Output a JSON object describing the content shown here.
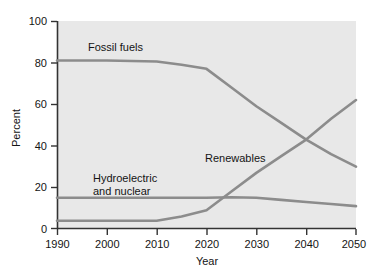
{
  "chart_data": {
    "type": "line",
    "title": "",
    "xlabel": "Year",
    "ylabel": "Percent",
    "xlim": [
      1990,
      2050
    ],
    "ylim": [
      0,
      100
    ],
    "grid": false,
    "legend_position": "inline-annotations",
    "xticks": [
      "1990",
      "2000",
      "2010",
      "2020",
      "2030",
      "2040",
      "2050"
    ],
    "xtick_values": [
      1990,
      2000,
      2010,
      2020,
      2030,
      2040,
      2050
    ],
    "yticks": [
      "0",
      "20",
      "40",
      "60",
      "80",
      "100"
    ],
    "ytick_values": [
      0,
      20,
      40,
      60,
      80,
      100
    ],
    "series": [
      {
        "name": "Fossil fuels",
        "color": "#8c8c8c",
        "x": [
          1990,
          2000,
          2010,
          2015,
          2020,
          2025,
          2030,
          2035,
          2040,
          2045,
          2050
        ],
        "values": [
          81,
          81,
          80.5,
          79,
          77,
          68,
          59,
          51,
          43,
          36,
          30
        ]
      },
      {
        "name": "Hydroelectric and nuclear",
        "color": "#8c8c8c",
        "x": [
          1990,
          2000,
          2010,
          2020,
          2025,
          2030,
          2035,
          2040,
          2045,
          2050
        ],
        "values": [
          15,
          15,
          15,
          15,
          15.3,
          15,
          14,
          13,
          12,
          11
        ]
      },
      {
        "name": "Renewables",
        "color": "#8c8c8c",
        "x": [
          1990,
          2000,
          2010,
          2015,
          2020,
          2025,
          2030,
          2035,
          2040,
          2045,
          2050
        ],
        "values": [
          4,
          4,
          4,
          6,
          9,
          18,
          27,
          35,
          43,
          53,
          62
        ]
      }
    ],
    "annotations": [
      {
        "text": "Fossil fuels",
        "x": 2007,
        "y": 89
      },
      {
        "text": "Renewables",
        "x": 2031,
        "y": 38
      },
      {
        "text": "Hydroelectric",
        "x": 2008,
        "y": 28
      },
      {
        "text": "and nuclear",
        "x": 2008,
        "y": 23
      }
    ]
  },
  "axes": {
    "y_title": "Percent",
    "x_title": "Year",
    "ytick_0": "0",
    "ytick_20": "20",
    "ytick_40": "40",
    "ytick_60": "60",
    "ytick_80": "80",
    "ytick_100": "100",
    "xtick_1990": "1990",
    "xtick_2000": "2000",
    "xtick_2010": "2010",
    "xtick_2020": "2020",
    "xtick_2030": "2030",
    "xtick_2040": "2040",
    "xtick_2050": "2050"
  },
  "labels": {
    "fossil_fuels": "Fossil fuels",
    "renewables": "Renewables",
    "hydro_line1": "Hydroelectric",
    "hydro_line2": "and nuclear"
  },
  "colors": {
    "plot_background": "#e8e8e8",
    "page_background": "#ffffff",
    "line": "#8c8c8c",
    "axis": "#333333",
    "text": "#141414"
  }
}
